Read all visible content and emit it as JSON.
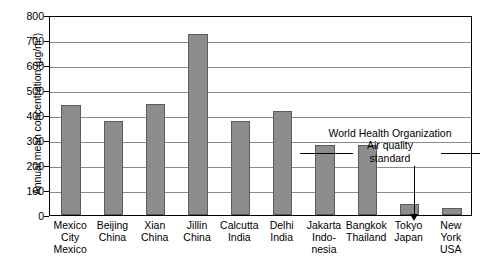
{
  "chart_data": {
    "type": "bar",
    "title": "",
    "xlabel": "",
    "ylabel": "Annual mean concentration (µg/m3)",
    "ylabel_base": "Annual mean concentration (µg/m",
    "ylabel_exponent": "3",
    "ylabel_close": ")",
    "ylim": [
      0,
      800
    ],
    "ytick_step": 100,
    "grid": true,
    "legend": "none",
    "categories": [
      "Mexico City Mexico",
      "Beijing China",
      "Xian China",
      "Jillin China",
      "Calcutta India",
      "Delhi India",
      "Jakarta Indonesia",
      "Bangkok Thailand",
      "Tokyo Japan",
      "New York USA"
    ],
    "category_lines": [
      [
        "Mexico",
        "City",
        "Mexico"
      ],
      [
        "Beijing",
        "China"
      ],
      [
        "Xian",
        "China"
      ],
      [
        "Jillin",
        "China"
      ],
      [
        "Calcutta",
        "India"
      ],
      [
        "Delhi",
        "India"
      ],
      [
        "Jakarta",
        "Indo-",
        "nesia"
      ],
      [
        "Bangkok",
        "Thailand"
      ],
      [
        "Tokyo",
        "Japan"
      ],
      [
        "New",
        "York",
        "USA"
      ]
    ],
    "values": [
      440,
      377,
      446,
      725,
      375,
      415,
      280,
      282,
      43,
      30
    ],
    "yticks": [
      800,
      700,
      600,
      500,
      400,
      300,
      200,
      100,
      0
    ],
    "ytick_labels": [
      "800",
      "700",
      "600",
      "500",
      "400",
      "300",
      "200",
      "100",
      "0"
    ],
    "bar_color": "#8d8d8d",
    "annotations": [
      {
        "lines": [
          "World Health Organization",
          "Air quality",
          "standard"
        ],
        "points_to_value": 100,
        "points_to_category": "Tokyo Japan"
      }
    ]
  },
  "colors": {
    "bar": "#8d8d8d",
    "bar_edge": "#5b5b5b",
    "grid": "#8a8a8a",
    "axis": "#000000",
    "background": "#ffffff"
  }
}
